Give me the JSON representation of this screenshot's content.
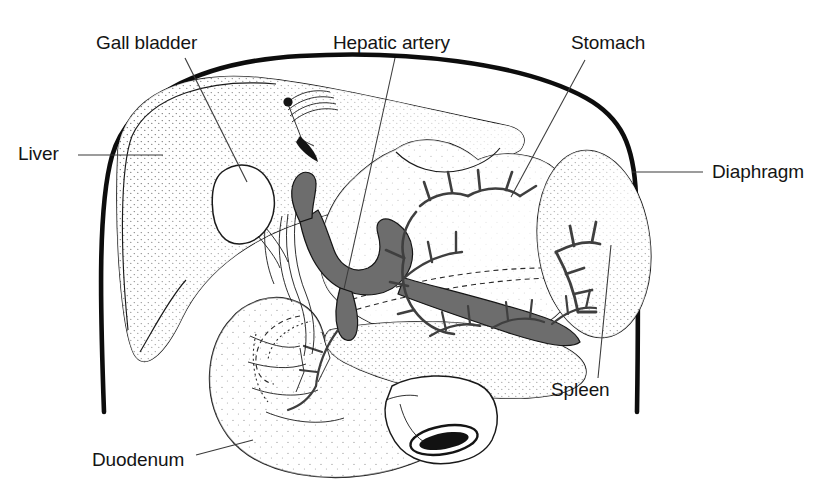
{
  "figure": {
    "background_color": "#ffffff",
    "ink_color": "#141414",
    "vessel_fill_color": "#6d6d6d",
    "label_font_size_px": 19
  },
  "labels": [
    {
      "id": "gall-bladder",
      "text": "Gall bladder",
      "x": 96,
      "y": 49,
      "anchor": "start",
      "leader": {
        "from": [
          185,
          58
        ],
        "to": [
          247,
          182
        ]
      }
    },
    {
      "id": "hepatic-artery",
      "text": "Hepatic artery",
      "x": 333,
      "y": 49,
      "anchor": "start",
      "leader": {
        "from": [
          395,
          58
        ],
        "to": [
          344,
          289
        ]
      }
    },
    {
      "id": "stomach",
      "text": "Stomach",
      "x": 571,
      "y": 49,
      "anchor": "start",
      "leader": {
        "from": [
          585,
          60
        ],
        "to": [
          511,
          197
        ]
      }
    },
    {
      "id": "liver",
      "text": "Liver",
      "x": 18,
      "y": 160,
      "anchor": "start",
      "leader": {
        "from": [
          78,
          155
        ],
        "to": [
          163,
          155
        ]
      }
    },
    {
      "id": "diaphragm",
      "text": "Diaphragm",
      "x": 712,
      "y": 178,
      "anchor": "start",
      "leader": {
        "from": [
          703,
          172
        ],
        "to": [
          632,
          172
        ]
      }
    },
    {
      "id": "spleen",
      "text": "Spleen",
      "x": 551,
      "y": 396,
      "anchor": "start",
      "leader": {
        "from": [
          598,
          378
        ],
        "to": [
          611,
          245
        ]
      }
    },
    {
      "id": "duodenum",
      "text": "Duodenum",
      "x": 92,
      "y": 466,
      "anchor": "start",
      "leader": {
        "from": [
          196,
          455
        ],
        "to": [
          253,
          440
        ]
      }
    }
  ],
  "structures": [
    {
      "id": "diaphragm-outline",
      "name": "Diaphragm",
      "kind": "outline"
    },
    {
      "id": "liver",
      "name": "Liver",
      "kind": "organ"
    },
    {
      "id": "gall-bladder",
      "name": "Gall bladder",
      "kind": "organ"
    },
    {
      "id": "stomach",
      "name": "Stomach",
      "kind": "organ"
    },
    {
      "id": "spleen",
      "name": "Spleen",
      "kind": "organ"
    },
    {
      "id": "duodenum",
      "name": "Duodenum",
      "kind": "organ"
    },
    {
      "id": "pancreas",
      "name": "Pancreas",
      "kind": "organ"
    },
    {
      "id": "hepatic-artery",
      "name": "Hepatic artery",
      "kind": "vessel"
    },
    {
      "id": "splenic-artery",
      "name": "Splenic artery",
      "kind": "vessel"
    },
    {
      "id": "gastric-arteries",
      "name": "Gastric arteries",
      "kind": "vessel"
    }
  ]
}
